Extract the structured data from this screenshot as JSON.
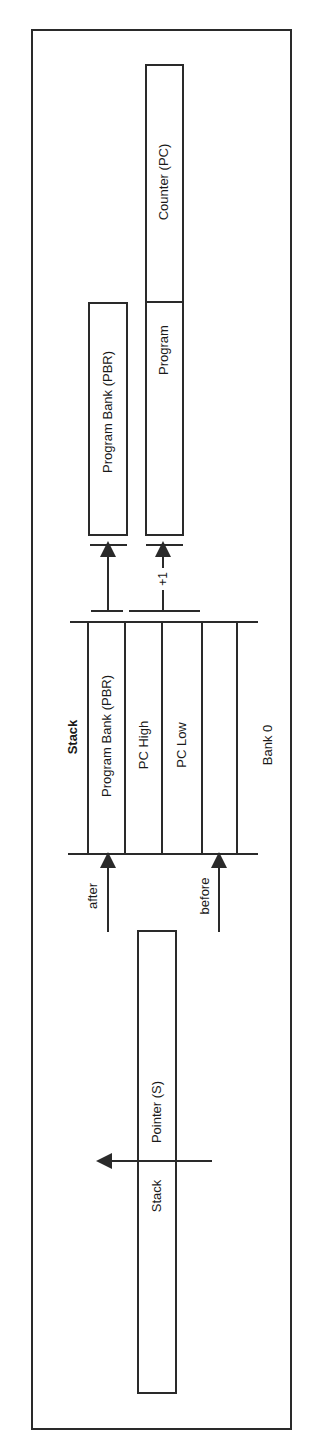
{
  "diagram": {
    "title": "Stack",
    "bank_label": "Bank 0",
    "registers": {
      "pbr": "Program Bank (PBR)",
      "pc_left": "Program",
      "pc_right": "Counter (PC)"
    },
    "stack_cells": [
      "Program Bank (PBR)",
      "PC High",
      "PC Low",
      ""
    ],
    "increment_label": "+1",
    "pointer_labels": {
      "after": "after",
      "before": "before"
    },
    "stack_pointer": {
      "left": "Stack",
      "right": "Pointer (S)"
    },
    "colors": {
      "line": "#2a2a2a",
      "background": "#ffffff"
    }
  }
}
